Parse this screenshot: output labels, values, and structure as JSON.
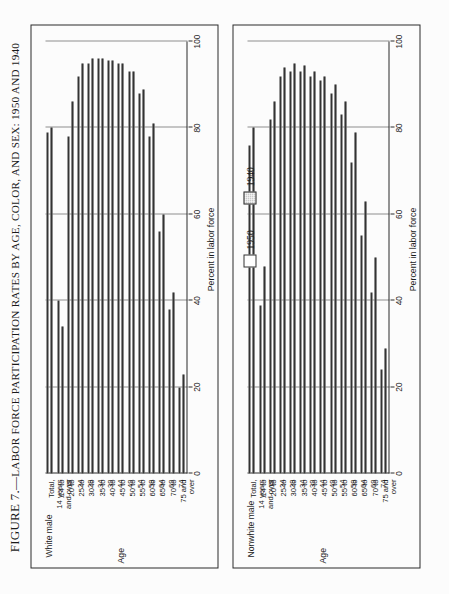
{
  "figure": {
    "number_label": "FIGURE 7.—",
    "title": "LABOR FORCE PARTICIPATION RATES BY AGE, COLOR, AND SEX: 1950 AND 1940"
  },
  "legend": {
    "items": [
      {
        "label": "1950",
        "fill": "#ffffff"
      },
      {
        "label": "1940",
        "fill": "#c9c9c9"
      }
    ]
  },
  "panels": [
    {
      "id": "white-male",
      "label": "White male"
    },
    {
      "id": "nonwhite-male",
      "label": "Nonwhite male"
    }
  ],
  "axes": {
    "value_axis_title": "Percent in labor force",
    "category_axis_title": "Age",
    "ticks": [
      "0",
      "20",
      "40",
      "60",
      "80",
      "100"
    ]
  },
  "chart_data": {
    "type": "bar",
    "title": "Labor Force Participation Rates by Age, Color, and Sex: 1950 and 1940",
    "xlabel": "Age",
    "ylabel": "Percent in labor force",
    "ylim": [
      0,
      100
    ],
    "orientation": "horizontal",
    "grid": true,
    "legend_position": "top-right",
    "categories": [
      "Total,\n14 years\nand over",
      "14 to\n19",
      "20 to\n24",
      "25 to\n29",
      "30 to\n34",
      "35 to\n39",
      "40 to\n44",
      "45 to\n49",
      "50 to\n54",
      "55 to\n59",
      "60 to\n64",
      "65 to\n69",
      "70 to\n74",
      "75 and\nover"
    ],
    "panels": [
      {
        "name": "White male",
        "series": [
          {
            "name": "1950",
            "values": [
              79.0,
              40.0,
              78.0,
              92.0,
              95.0,
              96.0,
              95.5,
              95.0,
              93.0,
              88.0,
              78.0,
              56.0,
              38.0,
              20.0
            ]
          },
          {
            "name": "1940",
            "values": [
              80.0,
              34.0,
              86.0,
              95.0,
              96.0,
              96.0,
              95.5,
              95.0,
              93.0,
              89.0,
              81.0,
              60.0,
              42.0,
              23.0
            ]
          }
        ]
      },
      {
        "name": "Nonwhite male",
        "series": [
          {
            "name": "1950",
            "values": [
              76.0,
              39.0,
              82.0,
              92.0,
              93.0,
              93.0,
              92.0,
              91.0,
              88.0,
              83.0,
              72.0,
              55.0,
              42.0,
              24.0
            ]
          },
          {
            "name": "1940",
            "values": [
              80.0,
              48.0,
              86.0,
              94.0,
              95.0,
              94.5,
              93.0,
              92.0,
              90.0,
              86.0,
              79.0,
              63.0,
              50.0,
              29.0
            ]
          }
        ]
      }
    ]
  }
}
